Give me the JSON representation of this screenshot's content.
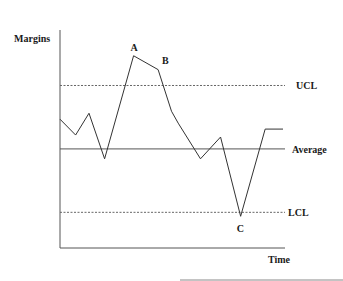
{
  "chart_data": {
    "type": "line",
    "title": "",
    "xlabel": "Time",
    "ylabel": "Margins",
    "reference_lines": [
      {
        "name": "UCL",
        "label": "UCL",
        "style": "dashed",
        "value": 0.82
      },
      {
        "name": "Average",
        "label": "Average",
        "style": "solid",
        "value": 0.5
      },
      {
        "name": "LCL",
        "label": "LCL",
        "style": "dashed",
        "value": 0.18
      }
    ],
    "series": [
      {
        "name": "Margins",
        "x": [
          0,
          0.07,
          0.13,
          0.2,
          0.33,
          0.44,
          0.5,
          0.53,
          0.63,
          0.72,
          0.81,
          0.92,
          1.0
        ],
        "values": [
          0.65,
          0.57,
          0.68,
          0.45,
          0.97,
          0.9,
          0.69,
          0.63,
          0.45,
          0.56,
          0.16,
          0.6,
          0.6
        ]
      }
    ],
    "annotations": [
      {
        "text": "A",
        "point_index": 4
      },
      {
        "text": "B",
        "point_index": 5
      },
      {
        "text": "C",
        "point_index": 10
      }
    ],
    "ylim": [
      0,
      1.1
    ],
    "xlim": [
      0,
      1.0
    ],
    "grid": false,
    "legend": "none"
  }
}
